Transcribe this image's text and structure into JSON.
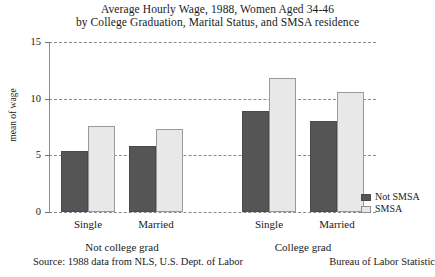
{
  "title": {
    "line1": "Average Hourly Wage, 1988, Women Aged 34-46",
    "line2": "by College Graduation, Marital Status, and SMSA residence"
  },
  "footer": {
    "source_left": "Source: 1988 data from NLS, U.S. Dept. of Labor",
    "source_right": "Bureau of Labor Statistic"
  },
  "legend": {
    "items": [
      {
        "label": "Not SMSA",
        "color": "#555555"
      },
      {
        "label": "SMSA",
        "color": "#e8e8e8"
      }
    ]
  },
  "chart_data": {
    "type": "bar",
    "title": "Average Hourly Wage, 1988, Women Aged 34-46 by College Graduation, Marital Status, and SMSA residence",
    "xlabel": "",
    "ylabel": "mean of wage",
    "ylim": [
      0,
      15
    ],
    "yticks": [
      0,
      5,
      10,
      15
    ],
    "ytick_labels": [
      "0",
      "5",
      "10",
      "15"
    ],
    "grid": true,
    "legend_position": "right-bottom",
    "categories": [
      "Single",
      "Married",
      "Single",
      "Married"
    ],
    "groups": [
      {
        "label": "Not college grad",
        "categories": [
          "Single",
          "Married"
        ]
      },
      {
        "label": "College grad",
        "categories": [
          "Single",
          "Married"
        ]
      }
    ],
    "series": [
      {
        "name": "Not SMSA",
        "color": "#555555",
        "values": [
          5.4,
          5.8,
          8.9,
          8.0
        ]
      },
      {
        "name": "SMSA",
        "color": "#e8e8e8",
        "values": [
          7.6,
          7.3,
          11.8,
          10.6
        ]
      }
    ]
  }
}
